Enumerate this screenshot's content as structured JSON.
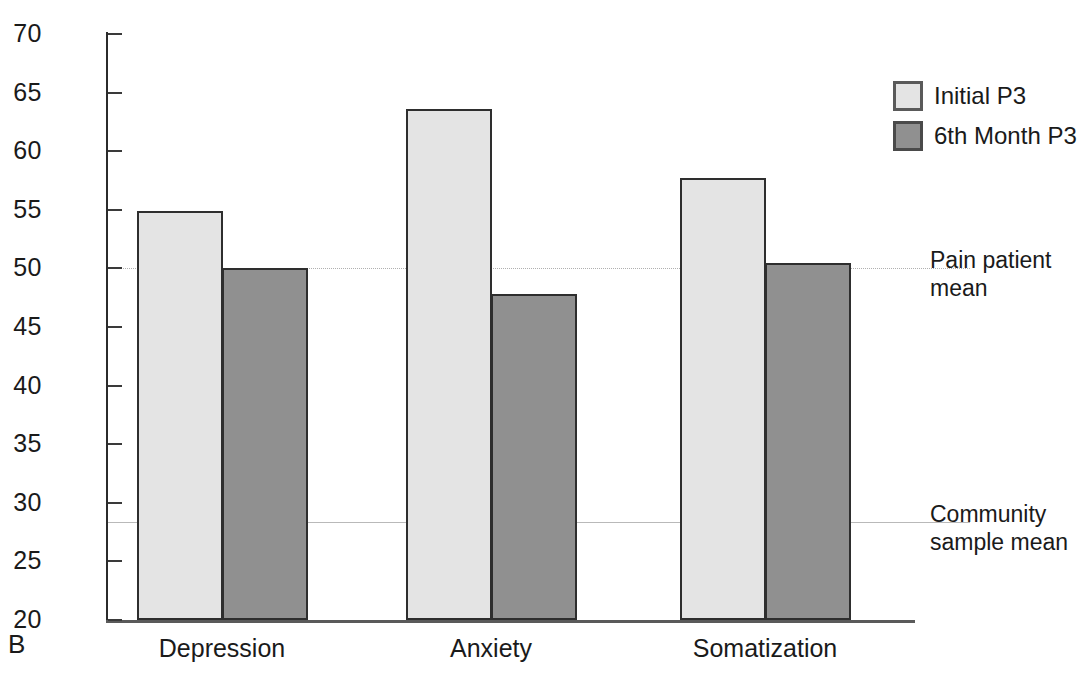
{
  "panel": {
    "label": "B"
  },
  "chart_data": {
    "type": "bar",
    "title": "",
    "xlabel": "",
    "ylabel": "",
    "ylim": [
      20,
      70
    ],
    "ytick_step": 5,
    "yticks": [
      70,
      65,
      60,
      55,
      50,
      45,
      40,
      35,
      30,
      25,
      20
    ],
    "grid": false,
    "categories": [
      "Depression",
      "Anxiety",
      "Somatization"
    ],
    "series": [
      {
        "name": "Initial P3",
        "color": "#e4e4e4",
        "values": [
          54.9,
          63.6,
          57.7
        ]
      },
      {
        "name": "6th Month P3",
        "color": "#909090",
        "values": [
          50.0,
          47.8,
          50.5
        ]
      }
    ],
    "reference_lines": [
      {
        "label": "Pain patient\nmean",
        "value": 50.0,
        "style": "dotted",
        "color": "#b0b0b0"
      },
      {
        "label": "Community\nsample mean",
        "value": 28.4,
        "style": "solid",
        "color": "#b9b9b9"
      }
    ],
    "legend_position": "top-right"
  }
}
